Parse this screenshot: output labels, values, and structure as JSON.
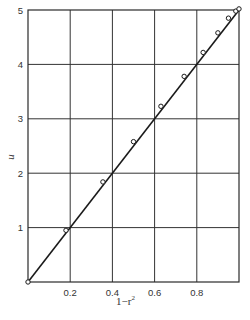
{
  "chart_data": {
    "type": "line",
    "title": "",
    "xlabel": "1 - r^2",
    "ylabel": "u",
    "xlim": [
      0,
      1.0
    ],
    "ylim": [
      0,
      5
    ],
    "grid": true,
    "legend": null,
    "x_ticks": [
      {
        "value": 0.2,
        "label": "0.2"
      },
      {
        "value": 0.4,
        "label": "0.4"
      },
      {
        "value": 0.6,
        "label": "0.6"
      },
      {
        "value": 0.8,
        "label": "0.8"
      }
    ],
    "y_ticks": [
      {
        "value": 1,
        "label": "1"
      },
      {
        "value": 2,
        "label": "2"
      },
      {
        "value": 3,
        "label": "3"
      },
      {
        "value": 4,
        "label": "4"
      },
      {
        "value": 5,
        "label": "5"
      }
    ],
    "series": [
      {
        "name": "fit line",
        "style": "solid line",
        "x": [
          0,
          1.0
        ],
        "y": [
          0,
          5.0
        ]
      },
      {
        "name": "data points",
        "style": "open circle markers",
        "x": [
          0.0,
          0.18,
          0.355,
          0.5,
          0.63,
          0.74,
          0.83,
          0.9,
          0.95,
          0.985,
          1.0
        ],
        "y": [
          0.0,
          0.95,
          1.84,
          2.58,
          3.23,
          3.78,
          4.22,
          4.58,
          4.85,
          4.98,
          5.02
        ]
      }
    ]
  },
  "labels": {
    "xlabel_main": "1−r",
    "xlabel_sup": "2",
    "ylabel": "u"
  }
}
